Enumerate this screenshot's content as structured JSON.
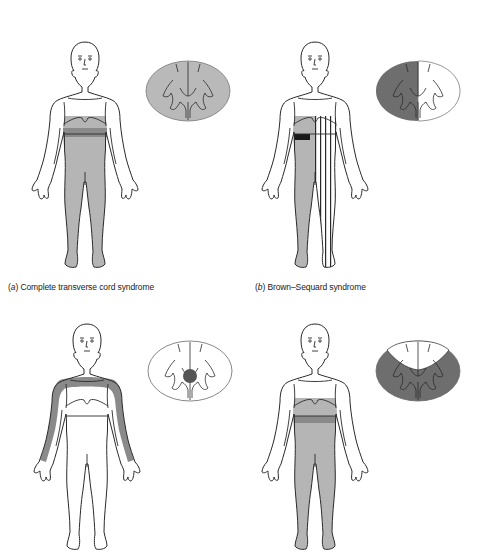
{
  "figure": {
    "panels": [
      {
        "id": "a",
        "letter": "a",
        "caption_open": "(",
        "caption_close": ")",
        "title": "Complete transverse cord syndrome",
        "body_shading": "both legs and lower trunk below level",
        "cord_shading": "entire cross-section"
      },
      {
        "id": "b",
        "letter": "b",
        "caption_open": "(",
        "caption_close": ")",
        "title": "Brown–Sequard syndrome",
        "body_shading": "one leg gray, opposite leg striped, dark band at level",
        "cord_shading": "left hemisection"
      },
      {
        "id": "c",
        "letter": "",
        "title": "",
        "body_shading": "cape distribution over shoulders and arms",
        "cord_shading": "central lesion"
      },
      {
        "id": "d",
        "letter": "",
        "title": "",
        "body_shading": "both legs and lower trunk",
        "cord_shading": "anterior two-thirds, dorsal columns spared"
      }
    ],
    "colors": {
      "line": "#2a2a2a",
      "light_gray": "#b9b9b9",
      "mid_gray": "#8e8e8e",
      "dark_gray": "#6e6e6e",
      "black_band": "#1a1a1a",
      "white": "#ffffff"
    }
  }
}
